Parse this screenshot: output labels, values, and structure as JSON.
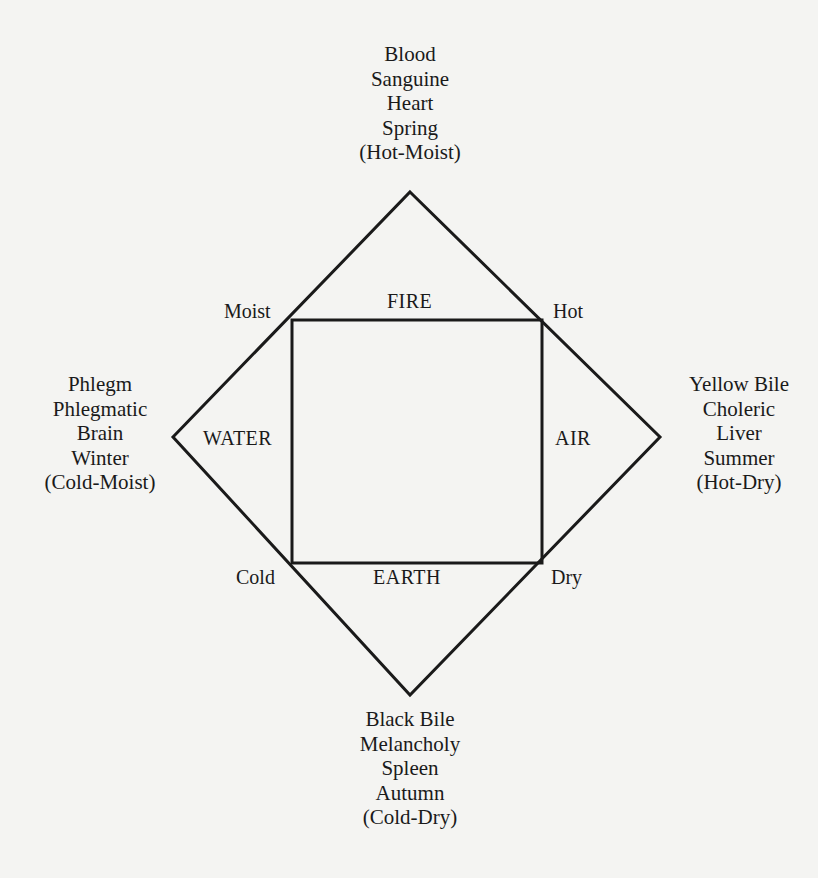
{
  "diagram": {
    "top": {
      "humor": "Blood",
      "temperament": "Sanguine",
      "organ": "Heart",
      "season": "Spring",
      "qualities": "(Hot-Moist)"
    },
    "left": {
      "humor": "Phlegm",
      "temperament": "Phlegmatic",
      "organ": "Brain",
      "season": "Winter",
      "qualities": "(Cold-Moist)"
    },
    "right": {
      "humor": "Yellow Bile",
      "temperament": "Choleric",
      "organ": "Liver",
      "season": "Summer",
      "qualities": "(Hot-Dry)"
    },
    "bottom": {
      "humor": "Black Bile",
      "temperament": "Melancholy",
      "organ": "Spleen",
      "season": "Autumn",
      "qualities": "(Cold-Dry)"
    },
    "elements": {
      "top": "FIRE",
      "left": "WATER",
      "right": "AIR",
      "bottom": "EARTH"
    },
    "qualities": {
      "top_left": "Moist",
      "top_right": "Hot",
      "bottom_left": "Cold",
      "bottom_right": "Dry"
    },
    "colors": {
      "ink": "#1a1a1a",
      "paper": "#f4f4f2"
    }
  }
}
